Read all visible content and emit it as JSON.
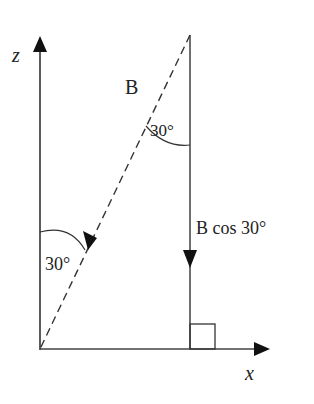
{
  "diagram": {
    "axes": {
      "z_label": "z",
      "x_label": "x"
    },
    "vector": {
      "label": "B",
      "style": "dashed"
    },
    "component": {
      "label": "B cos 30°"
    },
    "angles": {
      "top_angle": "30°",
      "bottom_angle": "30°"
    },
    "right_angle_marker": true,
    "colors": {
      "stroke": "#333333",
      "background": "#ffffff"
    }
  }
}
